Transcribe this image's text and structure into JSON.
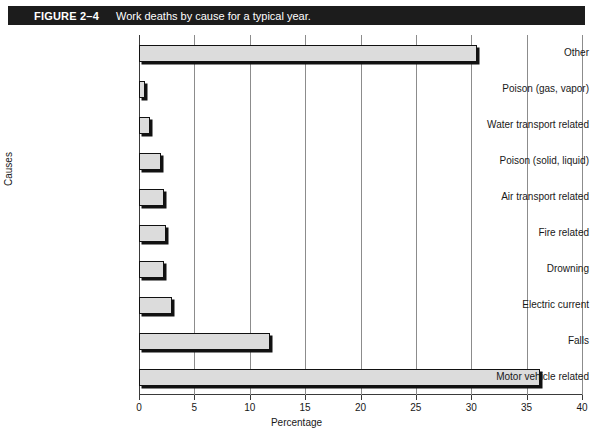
{
  "figure": {
    "number": "FIGURE 2–4",
    "caption": "Work deaths by cause for a typical year."
  },
  "chart_data": {
    "type": "bar",
    "orientation": "horizontal",
    "title": "Work deaths by cause for a typical year.",
    "xlabel": "Percentage",
    "ylabel": "Causes",
    "xlim": [
      0,
      40
    ],
    "xticks": [
      0,
      5,
      10,
      15,
      20,
      25,
      30,
      35,
      40
    ],
    "xtick_labels": [
      "0",
      "5",
      "10",
      "15",
      "20",
      "25",
      "30",
      "35",
      "40"
    ],
    "grid": "vertical",
    "legend": "none",
    "bar_fill_color": "#dcdcdc",
    "bar_edge_color": "#111111",
    "categories": [
      "Other",
      "Poison (gas, vapor)",
      "Water transport related",
      "Poison (solid, liquid)",
      "Air transport related",
      "Fire related",
      "Drowning",
      "Electric current",
      "Falls",
      "Motor vehicle related"
    ],
    "values": [
      30.5,
      0.5,
      1.0,
      2.0,
      2.3,
      2.4,
      2.3,
      3.0,
      11.8,
      36.2
    ]
  }
}
